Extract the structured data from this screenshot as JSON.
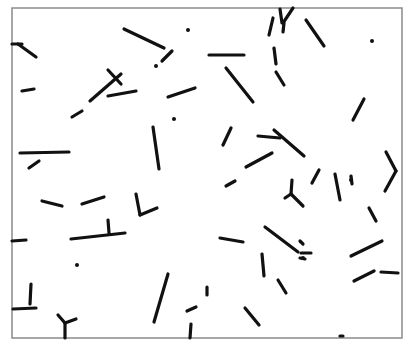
{
  "figure": {
    "background": "#ffffff",
    "frame_color": "#8a8a8a",
    "stroke_color": "#111111",
    "frame": {
      "x1": 12,
      "y1": 8,
      "x2": 402,
      "y2": 338
    },
    "segments": [
      [
        12,
        44,
        22,
        44
      ],
      [
        18,
        44,
        36,
        57
      ],
      [
        124,
        29,
        164,
        48
      ],
      [
        172,
        51,
        162,
        61
      ],
      [
        22,
        91,
        34,
        89
      ],
      [
        108,
        70,
        121,
        84
      ],
      [
        90,
        101,
        121,
        74
      ],
      [
        108,
        96,
        136,
        91
      ],
      [
        168,
        97,
        195,
        88
      ],
      [
        72,
        117,
        82,
        111
      ],
      [
        20,
        153,
        69,
        152
      ],
      [
        29,
        168,
        39,
        161
      ],
      [
        153,
        127,
        159,
        169
      ],
      [
        209,
        55,
        244,
        55
      ],
      [
        226,
        68,
        253,
        102
      ],
      [
        269,
        35,
        273,
        18
      ],
      [
        280,
        9,
        282,
        23
      ],
      [
        283,
        23,
        293,
        8
      ],
      [
        284,
        23,
        283,
        32
      ],
      [
        306,
        20,
        324,
        46
      ],
      [
        274,
        48,
        276,
        64
      ],
      [
        276,
        72,
        284,
        85
      ],
      [
        353,
        120,
        364,
        99
      ],
      [
        223,
        145,
        231,
        128
      ],
      [
        258,
        136,
        280,
        138
      ],
      [
        274,
        130,
        304,
        156
      ],
      [
        246,
        167,
        272,
        153
      ],
      [
        226,
        186,
        235,
        181
      ],
      [
        292,
        180,
        291,
        194
      ],
      [
        291,
        194,
        285,
        198
      ],
      [
        291,
        194,
        303,
        206
      ],
      [
        312,
        183,
        319,
        170
      ],
      [
        335,
        174,
        340,
        200
      ],
      [
        351,
        176,
        352,
        184
      ],
      [
        386,
        152,
        396,
        171
      ],
      [
        396,
        171,
        385,
        191
      ],
      [
        369,
        208,
        376,
        221
      ],
      [
        42,
        201,
        62,
        206
      ],
      [
        82,
        204,
        104,
        197
      ],
      [
        136,
        194,
        140,
        215
      ],
      [
        140,
        215,
        157,
        208
      ],
      [
        71,
        239,
        125,
        233
      ],
      [
        108,
        220,
        109,
        233
      ],
      [
        12,
        241,
        26,
        240
      ],
      [
        265,
        227,
        298,
        252
      ],
      [
        220,
        238,
        243,
        242
      ],
      [
        262,
        254,
        264,
        276
      ],
      [
        300,
        241,
        303,
        244
      ],
      [
        301,
        253,
        311,
        253
      ],
      [
        300,
        258,
        305,
        259
      ],
      [
        351,
        256,
        382,
        241
      ],
      [
        354,
        281,
        374,
        271
      ],
      [
        381,
        272,
        398,
        273
      ],
      [
        278,
        280,
        286,
        293
      ],
      [
        31,
        284,
        30,
        304
      ],
      [
        13,
        309,
        36,
        308
      ],
      [
        58,
        315,
        65,
        323
      ],
      [
        65,
        323,
        76,
        319
      ],
      [
        65,
        323,
        65,
        338
      ],
      [
        168,
        274,
        154,
        322
      ],
      [
        187,
        311,
        196,
        307
      ],
      [
        191,
        324,
        190,
        338
      ],
      [
        207,
        287,
        207,
        295
      ],
      [
        245,
        308,
        259,
        325
      ],
      [
        340,
        336,
        343,
        336
      ]
    ],
    "dots": [
      [
        188,
        30
      ],
      [
        156,
        66
      ],
      [
        174,
        119
      ],
      [
        77,
        265
      ],
      [
        372,
        41
      ],
      [
        351,
        180
      ],
      [
        303,
        258
      ]
    ]
  }
}
